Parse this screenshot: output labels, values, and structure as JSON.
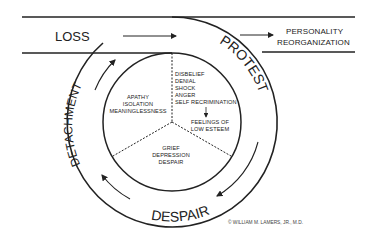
{
  "diagram": {
    "band": {
      "start_label": "LOSS",
      "end_label_line1": "PERSONALITY",
      "end_label_line2": "REORGANIZATION"
    },
    "stages": {
      "protest": "PROTEST",
      "despair": "DESPAIR",
      "detachment": "DETACHMENT"
    },
    "inner_sections": {
      "protest_feelings": [
        "DISBELIEF",
        "DENIAL",
        "SHOCK",
        "ANGER",
        "SELF RECRIMINATION"
      ],
      "protest_result_line1": "FEELINGS OF",
      "protest_result_line2": "LOW ESTEEM",
      "detachment_feelings": [
        "APATHY",
        "ISOLATION",
        "MEANINGLESSNESS"
      ],
      "despair_feelings": [
        "GRIEF",
        "DEPRESSION",
        "DESPAIR"
      ]
    },
    "copyright": "© WILLIAM M. LAMERS, JR., M.D."
  },
  "colors": {
    "line": "#222222",
    "background": "#ffffff"
  }
}
